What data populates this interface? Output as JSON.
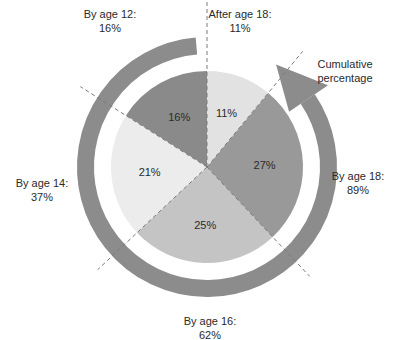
{
  "chart_data": {
    "type": "pie",
    "title": "",
    "slices": [
      {
        "name": "By age 12",
        "value": 16,
        "label": "16%",
        "color": "#8a8a8a"
      },
      {
        "name": "By age 14",
        "value": 21,
        "label": "21%",
        "color": "#ececec"
      },
      {
        "name": "By age 16",
        "value": 25,
        "label": "25%",
        "color": "#c4c4c4"
      },
      {
        "name": "By age 18",
        "value": 27,
        "label": "27%",
        "color": "#999999"
      },
      {
        "name": "After age 18",
        "value": 11,
        "label": "11%",
        "color": "#e2e2e2"
      }
    ],
    "outer_labels": [
      {
        "line1": "By age 12:",
        "line2": "16%"
      },
      {
        "line1": "By age 14:",
        "line2": "37%"
      },
      {
        "line1": "By age 16:",
        "line2": "62%"
      },
      {
        "line1": "By age 18:",
        "line2": "89%"
      },
      {
        "line1": "After age 18:",
        "line2": "11%"
      }
    ],
    "cumulative_arrow_label": [
      "Cumulative",
      "percentage"
    ],
    "ring_color": "#8c8c8c",
    "divider_color": "#7a7a7a"
  }
}
